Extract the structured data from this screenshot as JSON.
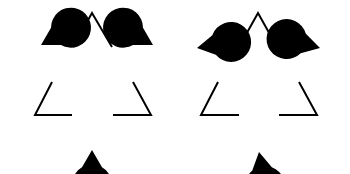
{
  "figure": {
    "colors": {
      "background": "#ffffff",
      "ink": "#000000"
    },
    "panels": [
      {
        "name": "aligned-kanizsa",
        "outline_stroke": 2,
        "outline_paths": [
          "M73,47 L92,13 L112,47",
          "M52,82 L35,115 L72,115",
          "M133,82 L151,115 L113,115"
        ],
        "pacmen": [
          {
            "cx": 41,
            "cy": 45,
            "r": 20,
            "mouth_dir": 30,
            "mouth_width": 60
          },
          {
            "cx": 153,
            "cy": 45,
            "r": 20,
            "mouth_dir": 150,
            "mouth_width": 60
          },
          {
            "cx": 92,
            "cy": 150,
            "r": 20,
            "mouth_dir": 270,
            "mouth_width": 60
          }
        ]
      },
      {
        "name": "rotated-kanizsa",
        "outline_stroke": 2,
        "outline_paths": [
          "M239,47 L258,13 L277,47",
          "M218,82 L201,115 L239,115",
          "M299,82 L317,115 L279,115"
        ],
        "pacmen": [
          {
            "cx": 197,
            "cy": 48,
            "r": 20,
            "mouth_dir": 10,
            "mouth_width": 60
          },
          {
            "cx": 320,
            "cy": 48,
            "r": 20,
            "mouth_dir": 165,
            "mouth_width": 60
          },
          {
            "cx": 259,
            "cy": 152,
            "r": 20,
            "mouth_dir": 280,
            "mouth_width": 60
          }
        ]
      }
    ]
  }
}
